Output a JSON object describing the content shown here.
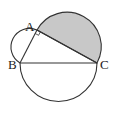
{
  "diagram": {
    "type": "geometry",
    "points": {
      "A": {
        "label": "A",
        "x": 37,
        "y": 30
      },
      "B": {
        "label": "B",
        "x": 20,
        "y": 63
      },
      "C": {
        "label": "C",
        "x": 97,
        "y": 63
      }
    },
    "labels": {
      "A": "A",
      "B": "B",
      "C": "C"
    },
    "right_angle_at": "A",
    "shaded_region": "semicircle on AC",
    "colors": {
      "stroke": "#333333",
      "shade": "#c8c8c8",
      "background": "#ffffff"
    }
  }
}
